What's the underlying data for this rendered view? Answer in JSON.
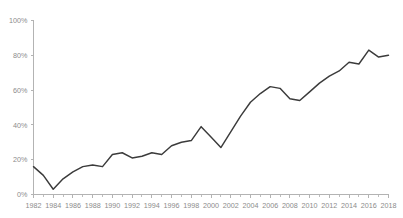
{
  "chart_data": {
    "type": "line",
    "title": "",
    "subtitle": "",
    "xlabel": "",
    "ylabel": "",
    "grid": false,
    "legend": false,
    "legend_position": "none",
    "line_color": "#3b3b3b",
    "axis_color": "#b3b3b3",
    "tick_label_color": "#8c8c8c",
    "xlim": [
      1982,
      2018
    ],
    "ylim": [
      0,
      100
    ],
    "y_ticks": [
      0,
      20,
      40,
      60,
      80,
      100
    ],
    "y_tick_labels": [
      "0%",
      "20%",
      "40%",
      "60%",
      "80%",
      "100%"
    ],
    "x_ticks": [
      1982,
      1984,
      1986,
      1988,
      1990,
      1992,
      1994,
      1996,
      1998,
      2000,
      2002,
      2004,
      2006,
      2008,
      2010,
      2012,
      2014,
      2016,
      2018
    ],
    "x_tick_labels": [
      "1982",
      "1984",
      "1986",
      "1988",
      "1990",
      "1992",
      "1994",
      "1996",
      "1998",
      "2000",
      "2002",
      "2004",
      "2006",
      "2008",
      "2010",
      "2012",
      "2014",
      "2016",
      "2018"
    ],
    "x_minor_tick_step": 1,
    "x": [
      1982,
      1983,
      1984,
      1985,
      1986,
      1987,
      1988,
      1989,
      1990,
      1991,
      1992,
      1993,
      1994,
      1995,
      1996,
      1997,
      1998,
      1999,
      2000,
      2001,
      2002,
      2003,
      2004,
      2005,
      2006,
      2007,
      2008,
      2009,
      2010,
      2011,
      2012,
      2013,
      2014,
      2015,
      2016,
      2017,
      2018
    ],
    "values": [
      16,
      11,
      3,
      9,
      13,
      16,
      17,
      16,
      23,
      24,
      21,
      22,
      24,
      23,
      28,
      30,
      31,
      39,
      33,
      27,
      36,
      45,
      53,
      58,
      62,
      61,
      55,
      54,
      59,
      64,
      68,
      71,
      76,
      75,
      83,
      79,
      80
    ],
    "series": [
      {
        "name": "",
        "values": [
          16,
          11,
          3,
          9,
          13,
          16,
          17,
          16,
          23,
          24,
          21,
          22,
          24,
          23,
          28,
          30,
          31,
          39,
          33,
          27,
          36,
          45,
          53,
          58,
          62,
          61,
          55,
          54,
          59,
          64,
          68,
          71,
          76,
          75,
          83,
          79,
          80
        ]
      }
    ]
  }
}
